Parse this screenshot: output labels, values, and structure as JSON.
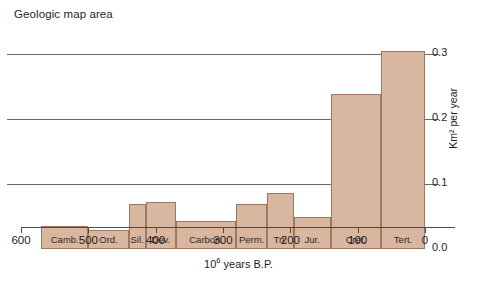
{
  "chart_data": {
    "type": "bar",
    "title": "Geologic map area",
    "xlabel": "10⁶ years B.P.",
    "ylabel": "Km² per year",
    "xlabel_prefix": "10",
    "xlabel_sup": "6",
    "xlabel_suffix": " years B.P.",
    "ylim": [
      0.0,
      0.31
    ],
    "xlim": [
      600,
      0
    ],
    "x_axis_reversed": true,
    "grid": "horizontal gridlines at 0.1, 0.2, 0.3",
    "legend": "none",
    "y_ticks": [
      "0.0",
      "0.1",
      "0.2",
      "0.3"
    ],
    "y_tick_values": [
      0.0,
      0.1,
      0.2,
      0.3
    ],
    "x_ticks": [
      "600",
      "500",
      "400",
      "300",
      "200",
      "100",
      "0"
    ],
    "x_tick_values": [
      600,
      500,
      400,
      300,
      200,
      100,
      0
    ],
    "categories": [
      "Camb.",
      "Ord.",
      "Sil.",
      "Dev.",
      "Carbon.",
      "Perm.",
      "Tri.",
      "Jur.",
      "Cret.",
      "Tert."
    ],
    "values": [
      0.035,
      0.029,
      0.069,
      0.072,
      0.043,
      0.069,
      0.086,
      0.049,
      0.238,
      0.305
    ],
    "bars": [
      {
        "label": "Camb.",
        "x_start": 570,
        "x_end": 500,
        "value": 0.035
      },
      {
        "label": "Ord.",
        "x_start": 500,
        "x_end": 440,
        "value": 0.029
      },
      {
        "label": "Sil.",
        "x_start": 440,
        "x_end": 415,
        "value": 0.069
      },
      {
        "label": "Dev.",
        "x_start": 415,
        "x_end": 370,
        "value": 0.072
      },
      {
        "label": "Carbon.",
        "x_start": 370,
        "x_end": 280,
        "value": 0.043
      },
      {
        "label": "Perm.",
        "x_start": 280,
        "x_end": 235,
        "value": 0.069
      },
      {
        "label": "Tri.",
        "x_start": 235,
        "x_end": 195,
        "value": 0.086
      },
      {
        "label": "Jur.",
        "x_start": 195,
        "x_end": 140,
        "value": 0.049
      },
      {
        "label": "Cret.",
        "x_start": 140,
        "x_end": 65,
        "value": 0.238
      },
      {
        "label": "Tert.",
        "x_start": 65,
        "x_end": 0,
        "value": 0.305
      }
    ],
    "colors": {
      "bar_fill": "#d9b6a0",
      "bar_stroke": "#9d7860",
      "gridline": "#6a6a6a",
      "axis": "#4a4a4a",
      "text": "#1d1d1d",
      "background": "#ffffff"
    }
  }
}
